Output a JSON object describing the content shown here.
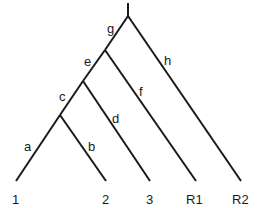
{
  "tree": {
    "root": {
      "x": 128,
      "y": 16,
      "stem_top": 3
    },
    "nodes": [
      {
        "id": "n_ab",
        "x": 60,
        "y": 115
      },
      {
        "id": "n_c",
        "x": 83,
        "y": 81
      },
      {
        "id": "n_e",
        "x": 105,
        "y": 50
      }
    ],
    "branch_labels": [
      {
        "text": "a",
        "x": 24,
        "y": 151
      },
      {
        "text": "b",
        "x": 88,
        "y": 151
      },
      {
        "text": "c",
        "x": 59,
        "y": 101
      },
      {
        "text": "d",
        "x": 112,
        "y": 123
      },
      {
        "text": "e",
        "x": 84,
        "y": 66
      },
      {
        "text": "f",
        "x": 138,
        "y": 96
      },
      {
        "text": "g",
        "x": 107,
        "y": 33
      },
      {
        "text": "h",
        "x": 164,
        "y": 65
      }
    ],
    "tips": [
      {
        "text": "1",
        "x": 16,
        "y": 181,
        "label_x": 12,
        "label_y": 204
      },
      {
        "text": "2",
        "x": 106,
        "y": 181,
        "label_x": 102,
        "label_y": 204
      },
      {
        "text": "3",
        "x": 150,
        "y": 181,
        "label_x": 146,
        "label_y": 204
      },
      {
        "text": "R1",
        "x": 196,
        "y": 181,
        "label_x": 186,
        "label_y": 204
      },
      {
        "text": "R2",
        "x": 241,
        "y": 181,
        "label_x": 232,
        "label_y": 204
      }
    ]
  },
  "labels": {
    "a": "a",
    "b": "b",
    "c": "c",
    "d": "d",
    "e": "e",
    "f": "f",
    "g": "g",
    "h": "h",
    "tip1": "1",
    "tip2": "2",
    "tip3": "3",
    "tipR1": "R1",
    "tipR2": "R2"
  }
}
